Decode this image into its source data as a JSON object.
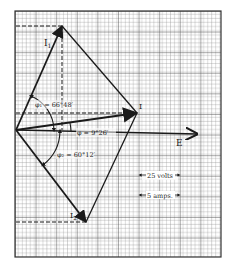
{
  "diagram": {
    "type": "phasor-diagram",
    "background": "graph-paper",
    "colors": {
      "paper": "#ffffff",
      "grid": "#8a8a8a",
      "grid_major": "#4a4a4a",
      "ink": "#1a1a1a"
    },
    "grid": {
      "x0": 15,
      "y0": 11,
      "x1": 221,
      "y1": 257,
      "minor_step": 4.12,
      "major_every": 5
    },
    "origin": {
      "x": 16,
      "y": 130
    },
    "vertices": {
      "top": {
        "x": 62,
        "y": 26
      },
      "right": {
        "x": 137,
        "y": 113
      },
      "bottom": {
        "x": 86,
        "y": 222
      },
      "e_tip": {
        "x": 197,
        "y": 134
      }
    },
    "labels": {
      "i1": "I",
      "i1_sub": "1",
      "i2": "I",
      "i2_sub": "2",
      "i": "I",
      "e": "E",
      "phi1": "φ₁ = 66°48′",
      "phi": "φ = 9°26′",
      "phi2": "φ₂ = 60°12′"
    },
    "scale": {
      "volts": "25 volts",
      "amps": "5 amps."
    }
  }
}
